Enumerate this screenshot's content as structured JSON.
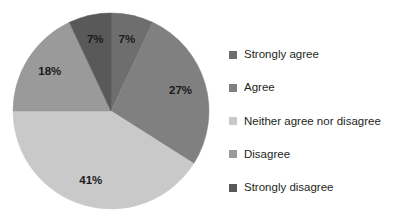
{
  "chart_data": {
    "type": "pie",
    "title": "",
    "xlabel": "",
    "ylabel": "",
    "legend_position": "right",
    "grid": false,
    "start_angle_deg": 0,
    "direction": "clockwise",
    "categories": [
      "Strongly agree",
      "Agree",
      "Neither agree nor disagree",
      "Disagree",
      "Strongly disagree"
    ],
    "values": [
      7,
      27,
      41,
      18,
      7
    ],
    "value_labels": [
      "7%",
      "27%",
      "41%",
      "18%",
      "7%"
    ],
    "colors": [
      "#6e6e6e",
      "#808080",
      "#c9c9c9",
      "#9a9a9a",
      "#595959"
    ],
    "slices": [
      {
        "label": "Strongly agree",
        "value": 7,
        "value_label": "7%",
        "color": "#6e6e6e"
      },
      {
        "label": "Agree",
        "value": 27,
        "value_label": "27%",
        "color": "#808080"
      },
      {
        "label": "Neither agree nor disagree",
        "value": 41,
        "value_label": "41%",
        "color": "#c9c9c9"
      },
      {
        "label": "Disagree",
        "value": 18,
        "value_label": "18%",
        "color": "#9a9a9a"
      },
      {
        "label": "Strongly disagree",
        "value": 7,
        "value_label": "7%",
        "color": "#595959"
      }
    ]
  },
  "legend": {
    "items": [
      {
        "label": "Strongly agree",
        "color": "#6e6e6e"
      },
      {
        "label": "Agree",
        "color": "#808080"
      },
      {
        "label": "Neither agree nor disagree",
        "color": "#c9c9c9"
      },
      {
        "label": "Disagree",
        "color": "#9a9a9a"
      },
      {
        "label": "Strongly disagree",
        "color": "#595959"
      }
    ]
  }
}
